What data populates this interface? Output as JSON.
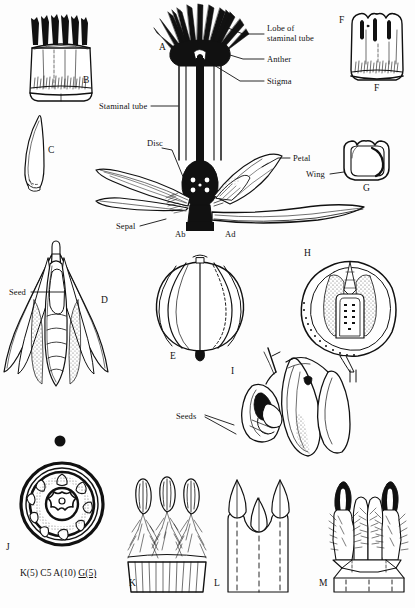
{
  "plate": {
    "title": "Botanical plate - floral dissection",
    "background": "#fdfdfd",
    "ink": "#111111",
    "width": 415,
    "height": 608
  },
  "callout_labels": [
    {
      "id": "lobe-of-staminal-tube",
      "line1": "Lobe of",
      "line2": "staminal tube"
    },
    {
      "id": "anther",
      "text": "Anther"
    },
    {
      "id": "stigma",
      "text": "Stigma"
    },
    {
      "id": "staminal-tube",
      "text": "Staminal tube"
    },
    {
      "id": "disc",
      "text": "Disc"
    },
    {
      "id": "sepal",
      "text": "Sepal"
    },
    {
      "id": "petal",
      "text": "Petal"
    },
    {
      "id": "wing",
      "text": "Wing"
    },
    {
      "id": "seed",
      "text": "Seed"
    },
    {
      "id": "seeds",
      "text": "Seeds"
    }
  ],
  "labels": {
    "lobe_l1": "Lobe of",
    "lobe_l2": "staminal tube",
    "anther": "Anther",
    "stigma": "Stigma",
    "staminal_tube": "Staminal tube",
    "disc": "Disc",
    "sepal": "Sepal",
    "petal": "Petal",
    "wing": "Wing",
    "seed": "Seed",
    "seeds": "Seeds",
    "ab": "Ab",
    "ad": "Ad"
  },
  "figure_letters": [
    {
      "id": "A",
      "text": "A"
    },
    {
      "id": "B",
      "text": "B"
    },
    {
      "id": "C",
      "text": "C"
    },
    {
      "id": "D",
      "text": "D"
    },
    {
      "id": "E",
      "text": "E"
    },
    {
      "id": "F-left",
      "text": "F"
    },
    {
      "id": "F-bottom",
      "text": "F"
    },
    {
      "id": "G",
      "text": "G"
    },
    {
      "id": "H",
      "text": "H"
    },
    {
      "id": "I",
      "text": "I"
    },
    {
      "id": "J",
      "text": "J"
    },
    {
      "id": "K",
      "text": "K"
    },
    {
      "id": "L",
      "text": "L"
    },
    {
      "id": "M",
      "text": "M"
    }
  ],
  "letters": {
    "A": "A",
    "B": "B",
    "C": "C",
    "D": "D",
    "E": "E",
    "F1": "F",
    "F2": "F",
    "G": "G",
    "H": "H",
    "I": "I",
    "J": "J",
    "K": "K",
    "L": "L",
    "M": "M"
  },
  "floral_formula": {
    "calyx": "K(5)",
    "corolla": "C5",
    "androecium": "A(10)",
    "gynoecium_prefix": "G",
    "gynoecium_count": "(5)",
    "full": "K(5) C5 A(10) G(5)"
  }
}
